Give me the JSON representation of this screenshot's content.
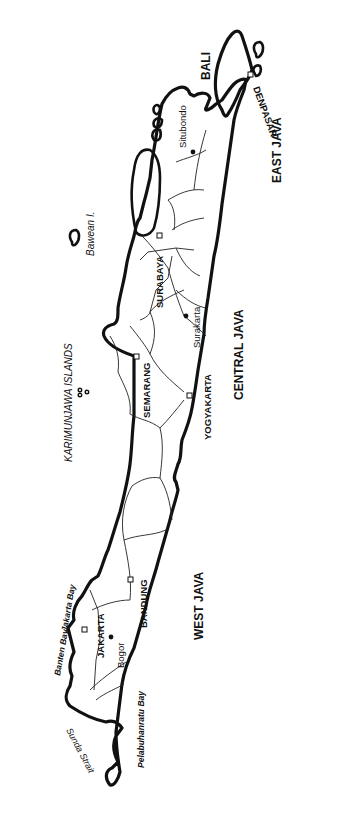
{
  "map": {
    "subject": "Java and Bali",
    "orientation": "rotated 90 degrees counter-clockwise (west at bottom, east at top)",
    "provinces": [
      {
        "label": "WEST JAVA"
      },
      {
        "label": "CENTRAL JAVA"
      },
      {
        "label": "EAST JAVA"
      },
      {
        "label": "BALI"
      }
    ],
    "capitals": [
      {
        "label": "JAKARTA",
        "marker": "square"
      },
      {
        "label": "BANDUNG",
        "marker": "square"
      },
      {
        "label": "SEMARANG",
        "marker": "square"
      },
      {
        "label": "YOGYAKARTA",
        "marker": "square"
      },
      {
        "label": "SURABAYA",
        "marker": "square"
      },
      {
        "label": "DENPASAR",
        "marker": "square"
      }
    ],
    "towns": [
      {
        "label": "Bogor",
        "marker": "dot"
      },
      {
        "label": "Surakarta",
        "marker": "dot"
      },
      {
        "label": "Situbondo",
        "marker": "dot"
      }
    ],
    "water_features": [
      {
        "label": "Sunda Strait"
      },
      {
        "label": "Banten Bay"
      },
      {
        "label": "Jakarta Bay"
      },
      {
        "label": "Pelabuhanratu Bay"
      }
    ],
    "islands": [
      {
        "label": "KARIMUNJAWA  ISLANDS"
      },
      {
        "label": "Bawean I."
      }
    ],
    "colors": {
      "line": "#111111",
      "background": "#ffffff"
    }
  }
}
